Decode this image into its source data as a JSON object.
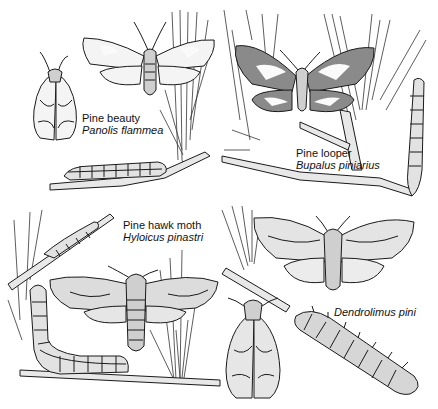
{
  "figure": {
    "panels": [
      {
        "id": "pine-beauty",
        "common_name": "Pine beauty",
        "latin_name": "Panolis flammea",
        "position": "top-left"
      },
      {
        "id": "pine-looper",
        "common_name": "Pine looper",
        "latin_name": "Bupalus piniarius",
        "position": "top-right"
      },
      {
        "id": "pine-hawk-moth",
        "common_name": "Pine hawk moth",
        "latin_name": "Hyloicus pinastri",
        "position": "bottom-left"
      },
      {
        "id": "dendrolimus",
        "common_name": "",
        "latin_name": "Dendrolimus pini",
        "position": "bottom-right"
      }
    ]
  }
}
